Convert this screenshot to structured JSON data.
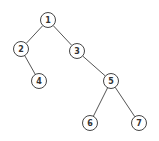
{
  "diagram": {
    "type": "binary-tree",
    "node_radius": 7.5,
    "colors": {
      "stroke": "#444444",
      "fill": "#ffffff",
      "text": "#333333"
    },
    "nodes": [
      {
        "id": "1",
        "label": "1",
        "x": 48,
        "y": 20
      },
      {
        "id": "2",
        "label": "2",
        "x": 21,
        "y": 49
      },
      {
        "id": "3",
        "label": "3",
        "x": 77,
        "y": 51
      },
      {
        "id": "4",
        "label": "4",
        "x": 39,
        "y": 81
      },
      {
        "id": "5",
        "label": "5",
        "x": 111,
        "y": 81
      },
      {
        "id": "6",
        "label": "6",
        "x": 90,
        "y": 123
      },
      {
        "id": "7",
        "label": "7",
        "x": 139,
        "y": 123
      }
    ],
    "edges": [
      {
        "from": "1",
        "to": "2"
      },
      {
        "from": "1",
        "to": "3"
      },
      {
        "from": "2",
        "to": "4"
      },
      {
        "from": "3",
        "to": "5"
      },
      {
        "from": "5",
        "to": "6"
      },
      {
        "from": "5",
        "to": "7"
      }
    ]
  }
}
